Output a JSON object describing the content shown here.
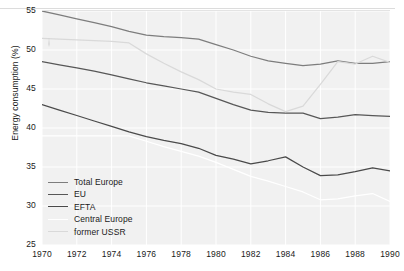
{
  "chart_data": {
    "type": "line",
    "title": "",
    "xlabel": "",
    "ylabel": "Energy consumption (%)",
    "xlim": [
      1970,
      1990
    ],
    "ylim": [
      25,
      55
    ],
    "grid": true,
    "legend_position": "lower-left inside plot",
    "x": [
      1970,
      1971,
      1972,
      1973,
      1974,
      1975,
      1976,
      1977,
      1978,
      1979,
      1980,
      1981,
      1982,
      1983,
      1984,
      1985,
      1986,
      1987,
      1988,
      1989,
      1990
    ],
    "xticks": [
      "1970",
      "1972",
      "1974",
      "1976",
      "1978",
      "1980",
      "1982",
      "1984",
      "1986",
      "1988",
      "1990"
    ],
    "yticks": [
      "25",
      "30",
      "35",
      "40",
      "45",
      "50",
      "55"
    ],
    "series": [
      {
        "name": "Total Europe",
        "color": "#7d7d7d",
        "values": [
          55.0,
          54.5,
          54.0,
          53.5,
          53.0,
          52.4,
          51.9,
          51.7,
          51.6,
          51.4,
          50.7,
          50.0,
          49.2,
          48.6,
          48.3,
          48.0,
          48.2,
          48.6,
          48.3,
          48.3,
          48.5
        ]
      },
      {
        "name": "EU",
        "color": "#575757",
        "values": [
          48.5,
          48.1,
          47.7,
          47.3,
          46.8,
          46.3,
          45.8,
          45.4,
          45.0,
          44.6,
          43.8,
          43.0,
          42.3,
          42.0,
          41.9,
          41.9,
          41.2,
          41.4,
          41.7,
          41.6,
          41.5
        ]
      },
      {
        "name": "EFTA",
        "color": "#4a4a4a",
        "values": [
          43.0,
          42.3,
          41.6,
          40.9,
          40.2,
          39.5,
          38.9,
          38.4,
          38.0,
          37.4,
          36.5,
          36.0,
          35.4,
          35.8,
          36.3,
          35.0,
          33.9,
          34.0,
          34.4,
          34.9,
          34.5
        ]
      },
      {
        "name": "Central Europe",
        "color": "#ffffff",
        "values": [
          39.0,
          39.0,
          39.0,
          39.0,
          39.0,
          39.0,
          38.3,
          37.6,
          37.0,
          36.4,
          35.6,
          34.7,
          33.8,
          33.2,
          32.5,
          31.8,
          30.8,
          30.9,
          31.3,
          31.6,
          30.6
        ]
      },
      {
        "name": "former USSR",
        "color": "#d9d9d9",
        "values": [
          51.5,
          51.4,
          51.3,
          51.2,
          51.1,
          50.9,
          49.5,
          48.3,
          47.2,
          46.2,
          45.0,
          44.6,
          44.3,
          43.1,
          42.1,
          42.8,
          45.6,
          48.5,
          48.2,
          49.2,
          48.4
        ]
      }
    ]
  },
  "legend": {
    "items": [
      {
        "label": "Total Europe",
        "color": "#7d7d7d"
      },
      {
        "label": "EU",
        "color": "#575757"
      },
      {
        "label": "EFTA",
        "color": "#4a4a4a"
      },
      {
        "label": "Central Europe",
        "color": "#ffffff"
      },
      {
        "label": "former USSR",
        "color": "#d9d9d9"
      }
    ]
  },
  "colors": {
    "plot_background": "#f1f1f1",
    "gridline": "#ffffff",
    "page_background": "#ffffff",
    "text": "#1a1a1a"
  }
}
